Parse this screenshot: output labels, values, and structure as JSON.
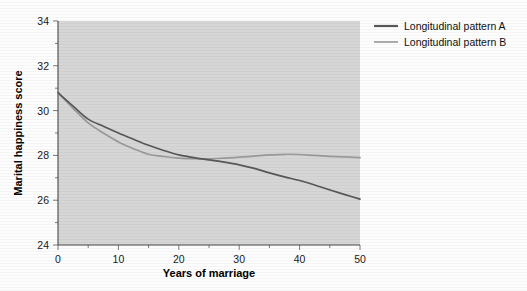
{
  "chart_data": {
    "type": "line",
    "title": "",
    "xlabel": "Years of marriage",
    "ylabel": "Marital happiness score",
    "xlim": [
      0,
      50
    ],
    "ylim": [
      24,
      34
    ],
    "xticks": [
      0,
      10,
      20,
      30,
      40,
      50
    ],
    "yticks": [
      24,
      26,
      28,
      30,
      32,
      34
    ],
    "grid": false,
    "legend_position": "top-right-outside",
    "plot_background": "#d6d6d6",
    "x": [
      0,
      2.5,
      5,
      7.5,
      10,
      12.5,
      15,
      17.5,
      20,
      22.5,
      25,
      27.5,
      30,
      32.5,
      35,
      37.5,
      40,
      42.5,
      45,
      47.5,
      50
    ],
    "series": [
      {
        "name": "Longitudinal pattern A",
        "color": "#58585a",
        "values": [
          30.8,
          30.2,
          29.62,
          29.3,
          29.0,
          28.72,
          28.45,
          28.22,
          28.02,
          27.9,
          27.8,
          27.7,
          27.58,
          27.42,
          27.22,
          27.04,
          26.88,
          26.68,
          26.46,
          26.25,
          26.05
        ]
      },
      {
        "name": "Longitudinal pattern B",
        "color": "#9a9a9c",
        "values": [
          30.8,
          30.1,
          29.45,
          29.0,
          28.6,
          28.3,
          28.05,
          27.95,
          27.88,
          27.85,
          27.85,
          27.88,
          27.92,
          27.97,
          28.02,
          28.05,
          28.04,
          28.0,
          27.96,
          27.93,
          27.9
        ]
      }
    ]
  },
  "legend": {
    "items": [
      {
        "label": "Longitudinal pattern A",
        "color": "#58585a"
      },
      {
        "label": "Longitudinal pattern B",
        "color": "#9a9a9c"
      }
    ]
  },
  "axes": {
    "x_title": "Years of marriage",
    "y_title": "Marital happiness score",
    "x_tick_labels": [
      "0",
      "10",
      "20",
      "30",
      "40",
      "50"
    ],
    "y_tick_labels": [
      "24",
      "26",
      "28",
      "30",
      "32",
      "34"
    ]
  }
}
